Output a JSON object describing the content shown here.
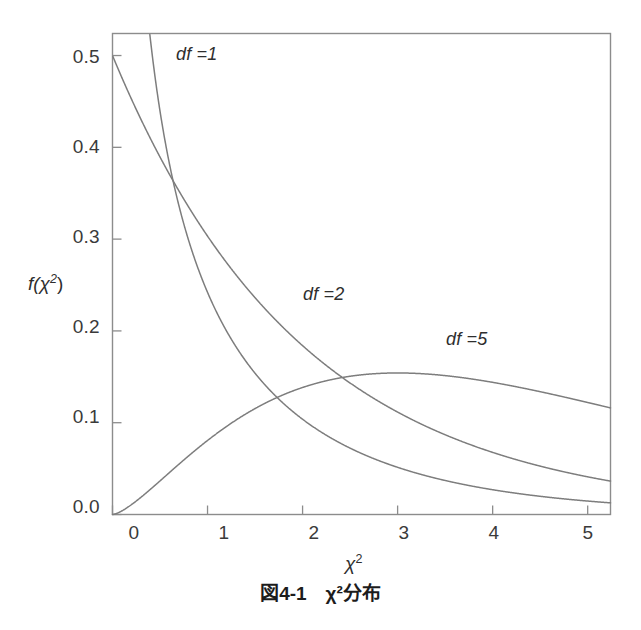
{
  "figure": {
    "caption": "図4-1　χ²分布",
    "caption_number": "図4-1",
    "caption_title": "χ²分布",
    "background_color": "#ffffff",
    "line_color": "#7d7d7d",
    "frame_color": "#8c8c8c",
    "text_color": "#2e2e2e"
  },
  "axes": {
    "y_label_prefix": "f(",
    "y_label_chi": "χ",
    "y_label_sup": "2",
    "y_label_suffix": ")",
    "x_label_chi": "χ",
    "x_label_sup": "2"
  },
  "chart_data": {
    "type": "line",
    "title": "χ²分布",
    "xlabel": "χ²",
    "ylabel": "f(χ²)",
    "xlim": [
      0,
      5.24
    ],
    "ylim": [
      0,
      0.524
    ],
    "grid": false,
    "legend": "inline-annotations",
    "xticks": [
      0,
      1,
      2,
      3,
      4,
      5
    ],
    "xtick_labels": [
      "0",
      "1",
      "2",
      "3",
      "4",
      "5"
    ],
    "yticks": [
      0.0,
      0.1,
      0.2,
      0.3,
      0.4,
      0.5
    ],
    "ytick_labels": [
      "0.0",
      "0.1",
      "0.2",
      "0.3",
      "0.4",
      "0.5"
    ],
    "annotations": [
      {
        "text": "df =1",
        "x": 0.53,
        "y": 0.475
      },
      {
        "text": "df =2",
        "x": 2.06,
        "y": 0.215
      },
      {
        "text": "df =5",
        "x": 3.65,
        "y": 0.178
      }
    ],
    "series": [
      {
        "name": "df =1",
        "df": 1,
        "x": [
          0.2,
          0.25,
          0.3,
          0.35,
          0.4,
          0.5,
          0.6,
          0.7,
          0.8,
          0.9,
          1.0,
          1.2,
          1.4,
          1.6,
          1.8,
          2.0,
          2.4,
          2.8,
          3.2,
          3.6,
          4.0,
          4.4,
          4.8,
          5.24
        ],
        "y": [
          0.807,
          0.704,
          0.628,
          0.569,
          0.521,
          0.44,
          0.383,
          0.339,
          0.304,
          0.276,
          0.242,
          0.2,
          0.167,
          0.141,
          0.12,
          0.104,
          0.078,
          0.06,
          0.046,
          0.036,
          0.027,
          0.021,
          0.017,
          0.013
        ]
      },
      {
        "name": "df =2",
        "df": 2,
        "x": [
          0.0,
          0.25,
          0.5,
          0.75,
          1.0,
          1.5,
          2.0,
          2.5,
          3.0,
          3.5,
          4.0,
          4.5,
          5.0,
          5.24
        ],
        "y": [
          0.485,
          0.441,
          0.39,
          0.344,
          0.303,
          0.236,
          0.184,
          0.143,
          0.112,
          0.087,
          0.068,
          0.053,
          0.041,
          0.037
        ]
      },
      {
        "name": "df =5",
        "df": 5,
        "x": [
          0.0,
          0.25,
          0.5,
          0.75,
          1.0,
          1.5,
          2.0,
          2.5,
          3.0,
          3.1,
          3.5,
          4.0,
          4.5,
          5.0,
          5.24
        ],
        "y": [
          0.0,
          0.02,
          0.044,
          0.068,
          0.09,
          0.124,
          0.144,
          0.152,
          0.154,
          0.154,
          0.15,
          0.141,
          0.13,
          0.122,
          0.114
        ]
      }
    ],
    "intersections": [
      {
        "series": [
          "df =1",
          "df =2"
        ],
        "x": 0.58,
        "y": 0.372
      },
      {
        "series": [
          "df =2",
          "df =5"
        ],
        "x": 2.46,
        "y": 0.147
      },
      {
        "series": [
          "df =1",
          "df =5"
        ],
        "x": 1.7,
        "y": 0.129
      }
    ]
  }
}
